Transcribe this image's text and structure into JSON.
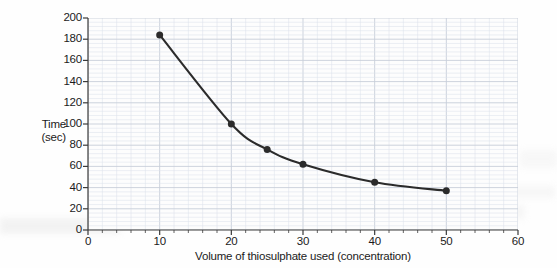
{
  "chart_data": {
    "type": "line",
    "title": "",
    "xlabel": "Volume of thiosulphate used (concentration)",
    "ylabel_line1": "Time",
    "ylabel_line2": "(sec)",
    "xlim": [
      0,
      60
    ],
    "ylim": [
      0,
      200
    ],
    "x_major_step": 10,
    "x_minor_step": 2,
    "y_major_step": 20,
    "y_minor_step": 4,
    "grid": true,
    "grid_color": "#c7ced9",
    "minor_grid_color": "#dde2ea",
    "legend": "none",
    "series_color": "#2b2b2b",
    "marker": "filled-circle",
    "xticks": [
      0,
      10,
      20,
      30,
      40,
      50,
      60
    ],
    "xtick_labels": [
      "0",
      "10",
      "20",
      "30",
      "40",
      "50",
      "60"
    ],
    "yticks": [
      0,
      20,
      40,
      60,
      80,
      100,
      120,
      140,
      160,
      180,
      200
    ],
    "ytick_labels": [
      "0",
      "20",
      "40",
      "60",
      "80",
      "100",
      "120",
      "140",
      "160",
      "180",
      "200"
    ],
    "series": [
      {
        "name": "Reaction time",
        "x": [
          10,
          20,
          25,
          30,
          40,
          50
        ],
        "values": [
          184,
          100,
          76,
          62,
          45,
          37
        ]
      }
    ]
  }
}
